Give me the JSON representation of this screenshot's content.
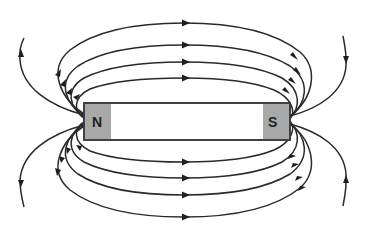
{
  "diagram": {
    "magnet": {
      "north_label": "N",
      "south_label": "S",
      "pole_color": "#a8a8a8",
      "body_color": "#ffffff",
      "outline_color": "#3a3a3a"
    },
    "field_lines": {
      "top_loops": 4,
      "bottom_loops": 4,
      "outer_open_lines": 4,
      "line_color": "#2a2a2a",
      "direction": "out of N, into S"
    }
  }
}
